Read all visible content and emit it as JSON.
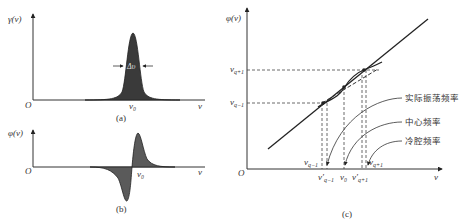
{
  "panel_a": {
    "ylabel": "γ(ν)",
    "origin": "O",
    "xlabel": "ν",
    "center_label": "ν₀",
    "width_label": "Δυ",
    "caption": "(a)"
  },
  "panel_b": {
    "ylabel": "φ(ν)",
    "origin": "O",
    "xlabel": "ν",
    "center_label": "ν₀",
    "caption": "(b)"
  },
  "panel_c": {
    "ylabel": "φ(ν)",
    "origin": "O",
    "xlabel": "ν",
    "y_ticks": [
      "ν_{q+1}",
      "ν_{q-1}"
    ],
    "y_tick_q_plus": "ν",
    "y_tick_q_plus_sub": "q+1",
    "y_tick_q_minus": "ν",
    "y_tick_q_minus_sub": "q−1",
    "x_label_vq_minus": "ν",
    "x_label_vq_minus_sub": "q−1",
    "x_label_vq_minus_prime": "ν′",
    "x_label_vq_minus_prime_sub": "q−1",
    "x_label_v0": "ν₀",
    "x_label_vq_plus_prime": "ν′",
    "x_label_vq_plus_prime_sub": "q+1",
    "x_label_vq_plus": "ν",
    "x_label_vq_plus_sub": "q+1",
    "annotations": {
      "actual": "实际振荡频率",
      "center": "中心频率",
      "cold": "冷腔频率"
    },
    "caption": "(c)"
  }
}
